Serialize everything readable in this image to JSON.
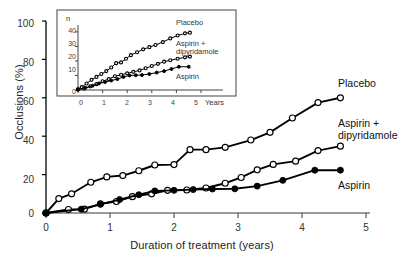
{
  "figure": {
    "xlabel": "Duration of treatment (years)",
    "ylabel": "Occlusions (%)"
  },
  "axes": {
    "y_ticks": [
      "100",
      "80",
      "60",
      "40",
      "20",
      "0"
    ],
    "x_ticks": [
      "0",
      "1",
      "2",
      "3",
      "4",
      "5"
    ]
  },
  "series_labels": {
    "placebo": "Placebo",
    "aspirin_dipyridamole_line1": "Aspirin +",
    "aspirin_dipyridamole_line2": "dipyridamole",
    "aspirin": "Aspirin"
  },
  "inset": {
    "ylabel": "n",
    "xlabel": "Years",
    "y_ticks": [
      "40",
      "30",
      "20",
      "10",
      "0"
    ],
    "x_ticks": [
      "0",
      "1",
      "2",
      "3",
      "4",
      "5"
    ],
    "labels": {
      "placebo": "Placebo",
      "aspirin_dipyridamole_line1": "Aspirin +",
      "aspirin_dipyridamole_line2": "dipyridamole",
      "aspirin": "Aspirin"
    }
  },
  "colors": {
    "line": "#000000",
    "open_marker_fill": "#ffffff",
    "closed_marker_fill": "#000000",
    "axis": "#000000",
    "text": "#1a1a1a"
  },
  "chart_data": {
    "type": "line",
    "title": "",
    "xlabel": "Duration of treatment (years)",
    "ylabel": "Occlusions (%)",
    "xlim": [
      0,
      5
    ],
    "ylim": [
      0,
      100
    ],
    "grid": false,
    "legend": "inline-right-labels",
    "series": [
      {
        "name": "Placebo",
        "marker": "open-circle",
        "points": [
          [
            0.0,
            0.0
          ],
          [
            0.2,
            7.5
          ],
          [
            0.4,
            10.0
          ],
          [
            0.7,
            16.0
          ],
          [
            0.95,
            18.8
          ],
          [
            1.2,
            19.5
          ],
          [
            1.45,
            22.0
          ],
          [
            1.7,
            25.0
          ],
          [
            2.0,
            25.2
          ],
          [
            2.25,
            33.0
          ],
          [
            2.5,
            33.0
          ],
          [
            2.8,
            34.2
          ],
          [
            3.2,
            38.0
          ],
          [
            3.5,
            42.0
          ],
          [
            3.85,
            49.5
          ],
          [
            4.25,
            57.5
          ],
          [
            4.6,
            60.0
          ]
        ]
      },
      {
        "name": "Aspirin + dipyridamole",
        "marker": "open-circle",
        "points": [
          [
            0.0,
            0.0
          ],
          [
            0.35,
            1.8
          ],
          [
            0.6,
            2.0
          ],
          [
            0.85,
            4.8
          ],
          [
            1.1,
            6.0
          ],
          [
            1.35,
            8.5
          ],
          [
            1.65,
            10.0
          ],
          [
            1.9,
            11.8
          ],
          [
            2.2,
            12.0
          ],
          [
            2.5,
            13.0
          ],
          [
            2.8,
            15.5
          ],
          [
            3.05,
            18.5
          ],
          [
            3.3,
            22.5
          ],
          [
            3.55,
            25.3
          ],
          [
            3.9,
            27.0
          ],
          [
            4.25,
            32.5
          ],
          [
            4.6,
            34.8
          ]
        ]
      },
      {
        "name": "Aspirin",
        "marker": "closed-circle",
        "points": [
          [
            0.0,
            0.0
          ],
          [
            0.55,
            2.0
          ],
          [
            0.85,
            4.5
          ],
          [
            1.15,
            7.0
          ],
          [
            1.45,
            9.5
          ],
          [
            1.7,
            11.5
          ],
          [
            2.0,
            11.8
          ],
          [
            2.3,
            12.2
          ],
          [
            2.6,
            12.5
          ],
          [
            2.95,
            12.6
          ],
          [
            3.3,
            14.0
          ],
          [
            3.7,
            17.0
          ],
          [
            4.2,
            22.3
          ],
          [
            4.6,
            22.3
          ]
        ]
      }
    ],
    "inset": {
      "type": "line",
      "xlabel": "Years",
      "ylabel": "n",
      "xlim": [
        0,
        5
      ],
      "ylim": [
        0,
        42
      ],
      "grid": false,
      "series": [
        {
          "name": "Placebo",
          "marker": "open-circle",
          "points": [
            [
              0.0,
              0.5
            ],
            [
              0.15,
              2.0
            ],
            [
              0.35,
              4.5
            ],
            [
              0.55,
              7.0
            ],
            [
              0.75,
              9.0
            ],
            [
              0.95,
              11.0
            ],
            [
              1.15,
              13.0
            ],
            [
              1.35,
              15.5
            ],
            [
              1.55,
              18.5
            ],
            [
              1.75,
              19.0
            ],
            [
              1.95,
              21.5
            ],
            [
              2.15,
              24.0
            ],
            [
              2.4,
              26.0
            ],
            [
              2.65,
              28.0
            ],
            [
              2.9,
              29.5
            ],
            [
              3.15,
              31.0
            ],
            [
              3.45,
              33.0
            ],
            [
              3.75,
              35.5
            ],
            [
              4.05,
              37.5
            ],
            [
              4.35,
              39.0
            ],
            [
              4.55,
              39.5
            ]
          ]
        },
        {
          "name": "Aspirin + dipyridamole",
          "marker": "open-circle",
          "points": [
            [
              0.0,
              0.3
            ],
            [
              0.25,
              1.0
            ],
            [
              0.5,
              2.5
            ],
            [
              0.75,
              4.0
            ],
            [
              1.0,
              6.0
            ],
            [
              1.25,
              7.5
            ],
            [
              1.5,
              9.5
            ],
            [
              1.75,
              10.5
            ],
            [
              2.0,
              11.5
            ],
            [
              2.25,
              12.5
            ],
            [
              2.5,
              13.5
            ],
            [
              2.75,
              15.0
            ],
            [
              3.0,
              16.5
            ],
            [
              3.25,
              18.0
            ],
            [
              3.5,
              19.5
            ],
            [
              3.75,
              20.5
            ],
            [
              4.05,
              21.5
            ],
            [
              4.35,
              22.5
            ],
            [
              4.55,
              23.0
            ]
          ]
        },
        {
          "name": "Aspirin",
          "marker": "closed-circle",
          "points": [
            [
              0.0,
              0.3
            ],
            [
              0.3,
              1.5
            ],
            [
              0.6,
              3.0
            ],
            [
              0.85,
              4.5
            ],
            [
              1.1,
              5.5
            ],
            [
              1.35,
              6.5
            ],
            [
              1.6,
              7.5
            ],
            [
              1.85,
              9.0
            ],
            [
              2.1,
              10.0
            ],
            [
              2.35,
              10.2
            ],
            [
              2.6,
              10.3
            ],
            [
              2.9,
              11.0
            ],
            [
              3.2,
              12.0
            ],
            [
              3.5,
              13.0
            ],
            [
              3.8,
              14.5
            ],
            [
              4.1,
              16.0
            ],
            [
              4.5,
              16.0
            ]
          ]
        }
      ]
    }
  }
}
